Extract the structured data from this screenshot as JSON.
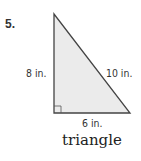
{
  "problem": {
    "number": "5."
  },
  "figure": {
    "shape": "right-triangle",
    "fill_color": "#ebebeb",
    "stroke_color": "#444444",
    "labels": {
      "left_leg": "8 in.",
      "hypotenuse": "10 in.",
      "bottom_leg": "6 in."
    },
    "right_angle_marker": true
  },
  "caption": "triangle"
}
